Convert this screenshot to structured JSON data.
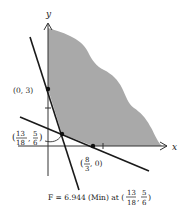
{
  "figure": {
    "axes": {
      "x_label": "x",
      "y_label": "y"
    },
    "points": [
      {
        "id": "p_0_3",
        "label_text": "(0, 3)",
        "x": 0,
        "y": 3
      },
      {
        "id": "p_min",
        "label_open": "(",
        "label_num1": "13",
        "label_den1": "18",
        "label_comma": ",",
        "label_num2": "5",
        "label_den2": "6",
        "label_close": ")",
        "x": 0.7222,
        "y": 0.8333
      },
      {
        "id": "p_8_3_0",
        "label_open": "(",
        "label_num": "8",
        "label_den": "3",
        "label_rest": ", 0)",
        "x": 2.6667,
        "y": 0
      }
    ],
    "caption": {
      "prefix": "F = 6.944 (Min) at (",
      "num1": "13",
      "den1": "18",
      "comma": ",",
      "num2": "5",
      "den2": "6",
      "suffix": ")"
    },
    "colors": {
      "shade": "#a9a9a9",
      "line": "#1a1a1a",
      "axis": "#333333"
    }
  }
}
